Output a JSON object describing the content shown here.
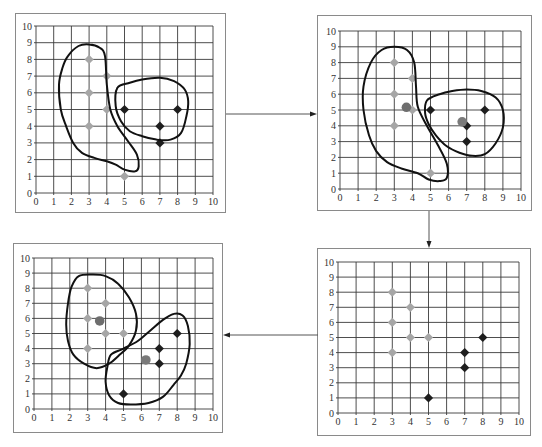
{
  "colors": {
    "cluster_a_point": "#a6a6a6",
    "cluster_b_point": "#1e1e1e",
    "centroid_a": "#6e6e6e",
    "centroid_b": "#7a7a7a",
    "outline": "#111111",
    "grid": "#3a3a3a"
  },
  "axes": {
    "x_ticks": [
      "0",
      "1",
      "2",
      "3",
      "4",
      "5",
      "6",
      "7",
      "8",
      "9",
      "10"
    ],
    "y_ticks": [
      "0",
      "1",
      "2",
      "3",
      "4",
      "5",
      "6",
      "7",
      "8",
      "9",
      "10"
    ],
    "xlim": [
      0,
      10
    ],
    "ylim": [
      0,
      10
    ]
  },
  "chart_data": [
    {
      "panel": "top-left",
      "step": 1,
      "type": "scatter",
      "xlim": [
        0,
        10
      ],
      "ylim": [
        0,
        10
      ],
      "grid": true,
      "series": [
        {
          "name": "cluster A (light diamonds)",
          "marker": "diamond",
          "points": [
            [
              3,
              8
            ],
            [
              3,
              6
            ],
            [
              3,
              4
            ],
            [
              4,
              7
            ],
            [
              4,
              5
            ],
            [
              5,
              1
            ]
          ]
        },
        {
          "name": "cluster B (dark diamonds)",
          "marker": "diamond",
          "points": [
            [
              5,
              5
            ],
            [
              7,
              4
            ],
            [
              7,
              3
            ],
            [
              8,
              5
            ]
          ]
        }
      ],
      "centroids": [],
      "outlines": [
        [
          [
            1.8,
            8.2
          ],
          [
            2.4,
            8.8
          ],
          [
            3.0,
            8.9
          ],
          [
            3.6,
            8.7
          ],
          [
            3.9,
            8.2
          ],
          [
            4.0,
            6.5
          ],
          [
            4.2,
            5.0
          ],
          [
            4.6,
            4.0
          ],
          [
            5.2,
            3.1
          ],
          [
            5.7,
            2.3
          ],
          [
            5.8,
            1.6
          ],
          [
            5.6,
            1.3
          ],
          [
            5.0,
            1.4
          ],
          [
            4.5,
            1.7
          ],
          [
            4.0,
            1.9
          ],
          [
            3.3,
            2.1
          ],
          [
            2.6,
            2.4
          ],
          [
            2.1,
            3.0
          ],
          [
            1.7,
            4.0
          ],
          [
            1.4,
            5.0
          ],
          [
            1.3,
            6.5
          ],
          [
            1.5,
            7.5
          ]
        ],
        [
          [
            4.6,
            6.3
          ],
          [
            5.3,
            6.6
          ],
          [
            6.0,
            6.8
          ],
          [
            7.0,
            6.9
          ],
          [
            7.8,
            6.7
          ],
          [
            8.4,
            6.2
          ],
          [
            8.6,
            5.5
          ],
          [
            8.5,
            4.6
          ],
          [
            8.2,
            3.6
          ],
          [
            7.6,
            3.2
          ],
          [
            6.8,
            3.2
          ],
          [
            6.0,
            3.4
          ],
          [
            5.3,
            3.7
          ],
          [
            4.8,
            4.3
          ],
          [
            4.5,
            5.2
          ]
        ]
      ]
    },
    {
      "panel": "top-right",
      "step": 2,
      "type": "scatter",
      "xlim": [
        0,
        10
      ],
      "ylim": [
        0,
        10
      ],
      "grid": true,
      "series": [
        {
          "name": "cluster A (light diamonds)",
          "marker": "diamond",
          "points": [
            [
              3,
              8
            ],
            [
              3,
              6
            ],
            [
              3,
              4
            ],
            [
              4,
              7
            ],
            [
              4,
              5
            ],
            [
              5,
              1
            ]
          ]
        },
        {
          "name": "cluster B (dark diamonds)",
          "marker": "diamond",
          "points": [
            [
              5,
              5
            ],
            [
              7,
              4
            ],
            [
              7,
              3
            ],
            [
              8,
              5
            ]
          ]
        }
      ],
      "centroids": [
        {
          "name": "centroid A",
          "x": 3.67,
          "y": 5.17
        },
        {
          "name": "centroid B",
          "x": 6.75,
          "y": 4.25
        }
      ],
      "outlines": [
        [
          [
            1.7,
            8.0
          ],
          [
            2.3,
            8.8
          ],
          [
            3.0,
            9.0
          ],
          [
            3.7,
            8.8
          ],
          [
            4.1,
            8.0
          ],
          [
            4.2,
            6.5
          ],
          [
            4.3,
            5.2
          ],
          [
            4.8,
            4.0
          ],
          [
            5.4,
            2.8
          ],
          [
            5.9,
            1.6
          ],
          [
            5.9,
            0.7
          ],
          [
            5.5,
            0.5
          ],
          [
            4.9,
            0.6
          ],
          [
            4.3,
            1.0
          ],
          [
            3.4,
            1.3
          ],
          [
            2.6,
            1.7
          ],
          [
            2.0,
            2.4
          ],
          [
            1.6,
            3.4
          ],
          [
            1.3,
            5.0
          ],
          [
            1.3,
            6.5
          ]
        ],
        [
          [
            4.8,
            5.6
          ],
          [
            5.5,
            6.0
          ],
          [
            6.2,
            6.2
          ],
          [
            7.0,
            6.3
          ],
          [
            7.8,
            6.2
          ],
          [
            8.6,
            5.8
          ],
          [
            9.0,
            5.0
          ],
          [
            9.0,
            3.9
          ],
          [
            8.6,
            2.9
          ],
          [
            8.0,
            2.2
          ],
          [
            7.3,
            2.1
          ],
          [
            6.6,
            2.3
          ],
          [
            5.9,
            2.7
          ],
          [
            5.3,
            3.4
          ],
          [
            4.9,
            4.1
          ],
          [
            4.7,
            4.8
          ]
        ]
      ]
    },
    {
      "panel": "bottom-right",
      "step": 3,
      "type": "scatter",
      "xlim": [
        0,
        10
      ],
      "ylim": [
        0,
        10
      ],
      "grid": true,
      "series": [
        {
          "name": "cluster A (light diamonds)",
          "marker": "diamond",
          "points": [
            [
              3,
              8
            ],
            [
              3,
              6
            ],
            [
              3,
              4
            ],
            [
              4,
              7
            ],
            [
              4,
              5
            ],
            [
              5,
              5
            ]
          ]
        },
        {
          "name": "cluster B (dark diamonds)",
          "marker": "diamond",
          "points": [
            [
              5,
              1
            ],
            [
              7,
              4
            ],
            [
              7,
              3
            ],
            [
              8,
              5
            ]
          ]
        }
      ],
      "centroids": [],
      "outlines": []
    },
    {
      "panel": "bottom-left",
      "step": 4,
      "type": "scatter",
      "xlim": [
        0,
        10
      ],
      "ylim": [
        0,
        10
      ],
      "grid": true,
      "series": [
        {
          "name": "cluster A (light diamonds)",
          "marker": "diamond",
          "points": [
            [
              3,
              8
            ],
            [
              3,
              6
            ],
            [
              3,
              4
            ],
            [
              4,
              7
            ],
            [
              4,
              5
            ],
            [
              5,
              5
            ]
          ]
        },
        {
          "name": "cluster B (dark diamonds)",
          "marker": "diamond",
          "points": [
            [
              5,
              1
            ],
            [
              7,
              4
            ],
            [
              7,
              3
            ],
            [
              8,
              5
            ]
          ]
        }
      ],
      "centroids": [
        {
          "name": "centroid A",
          "x": 3.67,
          "y": 5.83
        },
        {
          "name": "centroid B",
          "x": 6.25,
          "y": 3.25
        }
      ],
      "outlines": [
        [
          [
            2.1,
            8.1
          ],
          [
            2.5,
            8.8
          ],
          [
            3.3,
            8.9
          ],
          [
            4.0,
            8.8
          ],
          [
            4.7,
            8.3
          ],
          [
            5.3,
            7.4
          ],
          [
            5.7,
            6.3
          ],
          [
            5.7,
            5.2
          ],
          [
            5.3,
            4.2
          ],
          [
            4.7,
            3.5
          ],
          [
            4.2,
            3.0
          ],
          [
            3.5,
            2.7
          ],
          [
            2.8,
            3.0
          ],
          [
            2.2,
            3.6
          ],
          [
            1.9,
            4.5
          ],
          [
            1.8,
            5.6
          ],
          [
            1.9,
            7.0
          ]
        ],
        [
          [
            4.3,
            3.6
          ],
          [
            5.0,
            4.0
          ],
          [
            5.8,
            4.5
          ],
          [
            6.5,
            5.2
          ],
          [
            7.2,
            5.9
          ],
          [
            7.8,
            6.3
          ],
          [
            8.3,
            6.2
          ],
          [
            8.6,
            5.5
          ],
          [
            8.7,
            4.3
          ],
          [
            8.5,
            3.0
          ],
          [
            8.2,
            2.2
          ],
          [
            7.8,
            1.6
          ],
          [
            7.2,
            0.8
          ],
          [
            6.4,
            0.4
          ],
          [
            5.4,
            0.3
          ],
          [
            4.7,
            0.4
          ],
          [
            4.2,
            0.9
          ],
          [
            4.0,
            1.8
          ],
          [
            4.1,
            2.8
          ]
        ]
      ]
    }
  ],
  "arrows": [
    {
      "from": "top-left",
      "to": "top-right",
      "direction": "right"
    },
    {
      "from": "top-right",
      "to": "bottom-right",
      "direction": "down"
    },
    {
      "from": "bottom-right",
      "to": "bottom-left",
      "direction": "left"
    }
  ]
}
